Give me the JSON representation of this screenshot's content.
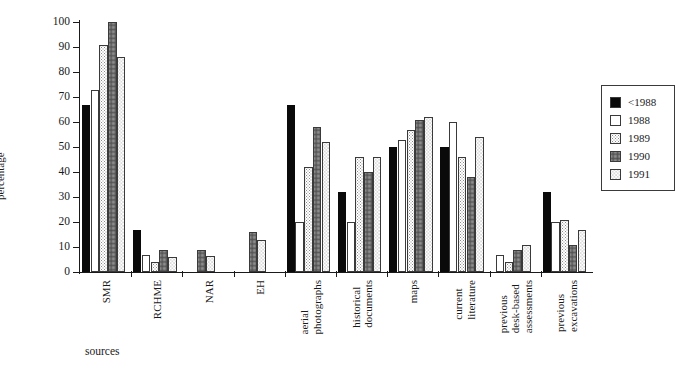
{
  "chart_data": {
    "type": "bar",
    "title": "",
    "xlabel": "sources",
    "ylabel": "percentage",
    "ylim": [
      0,
      100
    ],
    "ytick_step": 10,
    "yticks": [
      0,
      10,
      20,
      30,
      40,
      50,
      60,
      70,
      80,
      90,
      100
    ],
    "grid": false,
    "legend_position": "right",
    "categories": [
      "SMR",
      "RCHME",
      "NAR",
      "EH",
      "aerial photographs",
      "historical documents",
      "maps",
      "current literature",
      "previous desk-based assessments",
      "previous excavations"
    ],
    "category_lines": [
      [
        "SMR"
      ],
      [
        "RCHME"
      ],
      [
        "NAR"
      ],
      [
        "EH"
      ],
      [
        "aerial",
        "photographs"
      ],
      [
        "historical",
        "documents"
      ],
      [
        "maps"
      ],
      [
        "current",
        "literature"
      ],
      [
        "previous",
        "desk-based",
        "assessments"
      ],
      [
        "previous",
        "excavations"
      ]
    ],
    "series": [
      {
        "name": "<1988",
        "color": "#0a0a0a",
        "pattern": "solid-black",
        "values": [
          67,
          17,
          null,
          null,
          67,
          32,
          50,
          50,
          null,
          32
        ]
      },
      {
        "name": "1988",
        "color": "#ffffff",
        "pattern": "white",
        "values": [
          73,
          7,
          null,
          null,
          20,
          20,
          53,
          60,
          7,
          20
        ]
      },
      {
        "name": "1989",
        "color": "#ffffff",
        "pattern": "fine-dots",
        "values": [
          91,
          4,
          null,
          null,
          42,
          46,
          57,
          46,
          4,
          21
        ]
      },
      {
        "name": "1990",
        "color": "#f2f2f2",
        "pattern": "dense-dots",
        "values": [
          100,
          9,
          9,
          16,
          58,
          40,
          61,
          38,
          9,
          11
        ]
      },
      {
        "name": "1991",
        "color": "#ffffff",
        "pattern": "sparse-dots",
        "values": [
          86,
          6,
          6.5,
          13,
          52,
          46,
          62,
          54,
          11,
          17
        ]
      }
    ]
  },
  "legend": {
    "entries": [
      "<1988",
      "1988",
      "1989",
      "1990",
      "1991"
    ]
  }
}
